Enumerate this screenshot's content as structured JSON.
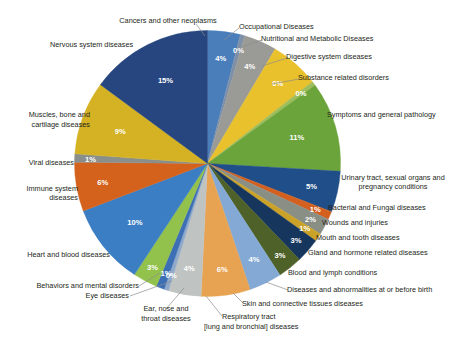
{
  "chart_data": {
    "type": "pie",
    "title": "",
    "subtitle": "",
    "legend_position": "labels-around-pie",
    "label_format": "percent",
    "total_percent": 100,
    "categories": [
      "Cancers and other neoplasms",
      "Occupational Diseases",
      "Nutritional and Metabolic Diseases",
      "Digestive system diseases",
      "Substance related disorders",
      "Symptoms and general pathology",
      "Urinary tract, sexual organs and pregnancy conditions",
      "Bacterial and Fungal diseases",
      "Wounds and injuries",
      "Mouth and tooth diseases",
      "Gland and hormone related diseases",
      "Blood and lymph conditions",
      "Diseases and abnormalities at or before birth",
      "Skin and connective tissues diseases",
      "Respiratory tract [lung and bronchial] diseases",
      "Ear, nose and throat diseases",
      "Eye diseases",
      "Behaviors and mental disorders",
      "Heart and blood diseases",
      "Immune system diseases",
      "Viral diseases",
      "Muscles, bone and cartilage diseases",
      "Nervous system diseases"
    ],
    "values": [
      4,
      0,
      4,
      6,
      0,
      11,
      5,
      1,
      2,
      1,
      3,
      3,
      4,
      6,
      4,
      0,
      1,
      3,
      10,
      6,
      1,
      9,
      15
    ],
    "value_labels": [
      "4%",
      "0%",
      "4%",
      "6%",
      "0%",
      "11%",
      "5%",
      "1%",
      "2%",
      "1%",
      "3%",
      "3%",
      "4%",
      "6%",
      "4%",
      "0%",
      "1%",
      "3%",
      "10%",
      "6%",
      "1%",
      "9%",
      "15%"
    ],
    "colors": [
      "#4a7ebb",
      "#7d90a8",
      "#9a9a96",
      "#e8c12c",
      "#9fbd5a",
      "#6ba43a",
      "#1f4e89",
      "#d4601f",
      "#8a8f86",
      "#c9a227",
      "#17365d",
      "#4e6128",
      "#84a9d4",
      "#e8a352",
      "#bfc3c1",
      "#8fa9cb",
      "#3d6fb5",
      "#92c14c",
      "#3b7ec4",
      "#d4621c",
      "#8a8f8c",
      "#d4b223",
      "#27467f"
    ],
    "slice_label_side": [
      "top",
      "top",
      "top-right",
      "right",
      "right",
      "right",
      "right",
      "right",
      "right",
      "right",
      "right",
      "right",
      "bottom-right",
      "bottom",
      "bottom",
      "bottom",
      "bottom-left",
      "left",
      "left",
      "left",
      "left",
      "left",
      "top-left"
    ]
  },
  "slices": [
    {
      "name": "Cancers and other neoplasms",
      "pct": "4%",
      "color": "#4a7ebb"
    },
    {
      "name": "Occupational Diseases",
      "pct": "0%",
      "color": "#7d90a8"
    },
    {
      "name": "Nutritional and Metabolic Diseases",
      "pct": "4%",
      "color": "#9a9a96"
    },
    {
      "name": "Digestive system diseases",
      "pct": "6%",
      "color": "#e8c12c"
    },
    {
      "name": "Substance related disorders",
      "pct": "0%",
      "color": "#9fbd5a"
    },
    {
      "name": "Symptoms and general pathology",
      "pct": "11%",
      "color": "#6ba43a"
    },
    {
      "name": "Urinary tract, sexual organs and pregnancy conditions",
      "pct": "5%",
      "color": "#1f4e89"
    },
    {
      "name": "Bacterial and Fungal diseases",
      "pct": "1%",
      "color": "#d4601f"
    },
    {
      "name": "Wounds and injuries",
      "pct": "2%",
      "color": "#8a8f86"
    },
    {
      "name": "Mouth and tooth diseases",
      "pct": "1%",
      "color": "#c9a227"
    },
    {
      "name": "Gland and hormone related diseases",
      "pct": "3%",
      "color": "#17365d"
    },
    {
      "name": "Blood and lymph conditions",
      "pct": "3%",
      "color": "#4e6128"
    },
    {
      "name": "Diseases and abnormalities at or before birth",
      "pct": "4%",
      "color": "#84a9d4"
    },
    {
      "name": "Skin and connective tissues diseases",
      "pct": "6%",
      "color": "#e8a352"
    },
    {
      "name": "Respiratory tract [lung and bronchial] diseases",
      "pct": "4%",
      "color": "#bfc3c1"
    },
    {
      "name": "Ear, nose and throat diseases",
      "pct": "0%",
      "color": "#8fa9cb"
    },
    {
      "name": "Eye diseases",
      "pct": "1%",
      "color": "#3d6fb5"
    },
    {
      "name": "Behaviors and mental disorders",
      "pct": "3%",
      "color": "#92c14c"
    },
    {
      "name": "Heart and blood diseases",
      "pct": "10%",
      "color": "#3b7ec4"
    },
    {
      "name": "Immune system diseases",
      "pct": "6%",
      "color": "#d4621c"
    },
    {
      "name": "Viral diseases",
      "pct": "1%",
      "color": "#8a8f8c"
    },
    {
      "name": "Muscles, bone and cartilage diseases",
      "pct": "9%",
      "color": "#d4b223"
    },
    {
      "name": "Nervous system diseases",
      "pct": "15%",
      "color": "#27467f"
    }
  ],
  "labels": {
    "cancers": "Cancers and other neoplasms",
    "occupational": "Occupational Diseases",
    "nutritional": "Nutritional and Metabolic Diseases",
    "digestive": "Digestive system diseases",
    "substance": "Substance related disorders",
    "symptoms": "Symptoms and general pathology",
    "urinary_l1": "Urinary tract, sexual organs and",
    "urinary_l2": "pregnancy conditions",
    "bacterial": "Bacterial and Fungal diseases",
    "wounds": "Wounds and injuries",
    "mouth": "Mouth and tooth diseases",
    "gland": "Gland and hormone related diseases",
    "blood": "Blood and lymph conditions",
    "birth": "Diseases and abnormalities at or before birth",
    "skin": "Skin and connective tissues diseases",
    "respiratory_l1": "Respiratory tract",
    "respiratory_l2": "[lung and bronchial] diseases",
    "ent_l1": "Ear, nose and",
    "ent_l2": "throat diseases",
    "eye": "Eye diseases",
    "behaviors": "Behaviors and mental disorders",
    "heart": "Heart and blood diseases",
    "immune_l1": "Immune system",
    "immune_l2": "diseases",
    "viral": "Viral diseases",
    "muscles_l1": "Muscles, bone and",
    "muscles_l2": "cartilage diseases",
    "nervous": "Nervous system diseases"
  },
  "percents": {
    "cancers": "4%",
    "occupational": "0%",
    "nutritional": "4%",
    "digestive": "6%",
    "substance": "0%",
    "symptoms": "11%",
    "urinary": "5%",
    "bacterial": "1%",
    "wounds": "2%",
    "mouth": "1%",
    "gland": "3%",
    "blood": "3%",
    "birth": "4%",
    "skin": "6%",
    "respiratory": "4%",
    "ent": "0%",
    "eye": "1%",
    "behaviors": "3%",
    "heart": "10%",
    "immune": "6%",
    "viral": "1%",
    "muscles": "9%",
    "nervous": "15%"
  }
}
